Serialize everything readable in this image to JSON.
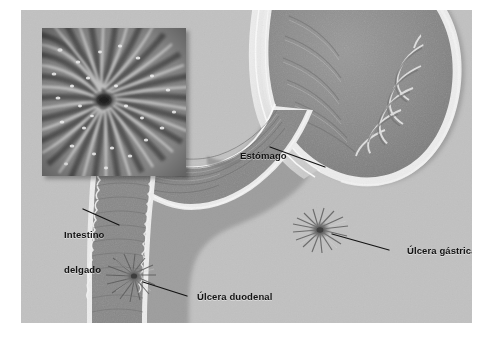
{
  "figure": {
    "kind": "medical-illustration",
    "plate_background": "#c2c2c2",
    "organ_fill": "#8e8e8e",
    "organ_outline": "#f0f0f0",
    "label_color": "#131313",
    "leader_color": "#111111"
  },
  "inset": {
    "name": "gastric-mucosa-closeup",
    "description": "Primer plano de los pliegues de la mucosa gástrica convergiendo hacia el cráter de la úlcera"
  },
  "labels": [
    {
      "id": "estomago",
      "text": "Estómago",
      "lines": [
        "Estómago"
      ]
    },
    {
      "id": "intestino-delgado",
      "text": "Intestino delgado",
      "lines": [
        "Intestino",
        "delgado"
      ]
    },
    {
      "id": "ulcera-gastrica",
      "text": "Úlcera gástrica",
      "lines": [
        "Úlcera gástrica"
      ]
    },
    {
      "id": "ulcera-duodenal",
      "text": "Úlcera duodenal",
      "lines": [
        "Úlcera duodenal"
      ]
    }
  ],
  "label_text": {
    "estomago": "Estómago",
    "intestino_line1": "Intestino",
    "intestino_line2": "delgado",
    "ulcera_gastrica": "Úlcera gástrica",
    "ulcera_duodenal": "Úlcera duodenal"
  },
  "structures": [
    {
      "name": "esofago",
      "label": "Esófago"
    },
    {
      "name": "fundus",
      "label": "Fundus gástrico"
    },
    {
      "name": "cuerpo",
      "label": "Cuerpo gástrico"
    },
    {
      "name": "antro-piloro",
      "label": "Antro y píloro"
    },
    {
      "name": "duodeno",
      "label": "Duodeno"
    }
  ],
  "ulcers": [
    {
      "name": "ulcera-gastrica",
      "label": "Úlcera gástrica"
    },
    {
      "name": "ulcera-duodenal",
      "label": "Úlcera duodenal"
    }
  ]
}
